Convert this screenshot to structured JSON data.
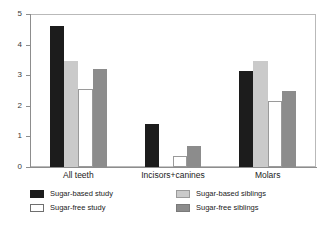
{
  "chart_data": {
    "type": "bar",
    "title": "",
    "subtitle": "",
    "xlabel": "",
    "ylabel": "",
    "ylim": [
      0,
      5
    ],
    "yticks": [
      0,
      1,
      2,
      3,
      4,
      5
    ],
    "ytick_labels": [
      "0",
      "1",
      "2",
      "3",
      "4",
      "5"
    ],
    "grid": false,
    "legend_position": "below",
    "categories": [
      "All teeth",
      "Incisors+canines",
      "Molars"
    ],
    "series": [
      {
        "name": "Sugar-based study",
        "color": "#1c1c1c",
        "values": [
          4.6,
          1.4,
          3.15
        ]
      },
      {
        "name": "Sugar-based siblings",
        "color": "#cacaca",
        "values": [
          3.45,
          0.03,
          3.45
        ]
      },
      {
        "name": "Sugar-free study",
        "color": "#ffffff",
        "values": [
          2.55,
          0.37,
          2.15
        ]
      },
      {
        "name": "Sugar-free siblings",
        "color": "#8c8c8c",
        "values": [
          3.2,
          0.68,
          2.5
        ]
      }
    ],
    "legend_order": [
      "Sugar-based study",
      "Sugar-based siblings",
      "Sugar-free study",
      "Sugar-free siblings"
    ],
    "axis_color": "#8d8d8d",
    "frame_color": "#b9b9b9",
    "background": "#ffffff"
  }
}
